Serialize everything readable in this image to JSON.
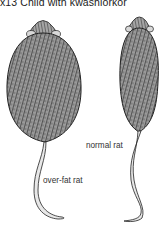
{
  "caption": "x13 Child with kwashiorkor",
  "figure": {
    "labels": {
      "normal": "normal rat",
      "overfat": "over-fat rat"
    },
    "colors": {
      "ink": "#2a2a2a",
      "fur_dark": "#3a3a3a",
      "fur_mid": "#6e6e6e",
      "background": "#ffffff"
    }
  }
}
